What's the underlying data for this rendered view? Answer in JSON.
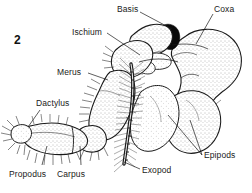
{
  "figure": {
    "number": "2",
    "number_pos": {
      "x": 14,
      "y": 34
    },
    "background_color": "#ffffff",
    "ink_color": "#1a1a1a",
    "stipple_color": "#595959",
    "dark_accent_color": "#000000",
    "width": 252,
    "height": 193
  },
  "labels": [
    {
      "id": "basis",
      "text": "Basis",
      "x": 117,
      "y": 5,
      "leader": {
        "x1": 140,
        "y1": 12,
        "x2": 172,
        "y2": 29
      }
    },
    {
      "id": "coxa",
      "text": "Coxa",
      "x": 214,
      "y": 5,
      "leader": {
        "x1": 213,
        "y1": 14,
        "x2": 196,
        "y2": 44
      }
    },
    {
      "id": "ischium",
      "text": "Ischium",
      "x": 72,
      "y": 28,
      "leader": {
        "x1": 107,
        "y1": 33,
        "x2": 140,
        "y2": 55
      }
    },
    {
      "id": "merus",
      "text": "Merus",
      "x": 57,
      "y": 68,
      "leader": {
        "x1": 88,
        "y1": 73,
        "x2": 108,
        "y2": 80
      }
    },
    {
      "id": "dactylus",
      "text": "Dactylus",
      "x": 36,
      "y": 99,
      "leader": {
        "x1": 40,
        "y1": 110,
        "x2": 30,
        "y2": 126
      }
    },
    {
      "id": "propodus",
      "text": "Propodus",
      "x": 9,
      "y": 170,
      "leader": {
        "x1": 42,
        "y1": 167,
        "x2": 47,
        "y2": 146
      }
    },
    {
      "id": "carpus",
      "text": "Carpus",
      "x": 57,
      "y": 170,
      "leader": {
        "x1": 81,
        "y1": 167,
        "x2": 80,
        "y2": 146
      }
    },
    {
      "id": "exopod",
      "text": "Exopod",
      "x": 142,
      "y": 170,
      "leader": {
        "x1": 140,
        "y1": 170,
        "x2": 124,
        "y2": 162
      }
    },
    {
      "id": "epipods",
      "text": "Epipods",
      "x": 204,
      "y": 152,
      "leaders": [
        {
          "x1": 202,
          "y1": 155,
          "x2": 168,
          "y2": 115
        },
        {
          "x1": 202,
          "y1": 155,
          "x2": 190,
          "y2": 118
        }
      ]
    }
  ],
  "anatomy": {
    "segments": [
      {
        "name": "coxa",
        "description": "large stippled basal lobe upper right"
      },
      {
        "name": "basis",
        "description": "short segment joining coxa to ischium"
      },
      {
        "name": "ischium",
        "description": "setae-fringed segment below basis"
      },
      {
        "name": "merus",
        "description": "long stippled segment descending left"
      },
      {
        "name": "carpus",
        "description": "short segment at elbow"
      },
      {
        "name": "propodus",
        "description": "long horizontal segment lower left"
      },
      {
        "name": "dactylus",
        "description": "terminal claw tip far left"
      },
      {
        "name": "exopod",
        "description": "long segmented flagellum with dense setae"
      },
      {
        "name": "epipods",
        "description": "two large rounded gill lobes lower right"
      }
    ]
  }
}
